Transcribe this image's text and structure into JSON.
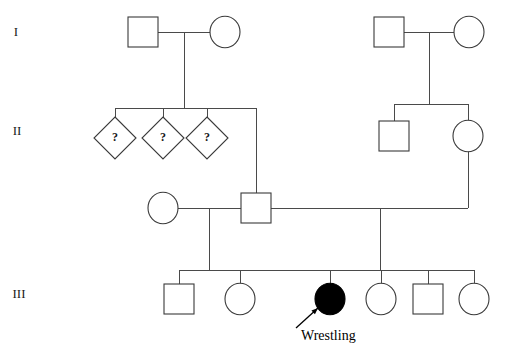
{
  "figure": {
    "type": "pedigree-chart",
    "background_color": "#ffffff",
    "line_color": "#4a4a4a",
    "symbol_stroke_color": "#3a3a3a",
    "affected_fill_color": "#000000",
    "unaffected_fill_color": "#ffffff",
    "width": 505,
    "height": 359
  },
  "generation_labels": [
    {
      "name": "generation-1",
      "text": "I",
      "x": 16,
      "y": 33
    },
    {
      "name": "generation-2",
      "text": "II",
      "x": 17,
      "y": 132
    },
    {
      "name": "generation-3",
      "text": "III",
      "x": 19,
      "y": 295
    }
  ],
  "annotations": [
    {
      "name": "proband-annotation",
      "text": "Wrestling",
      "text_x": 301,
      "text_y": 337,
      "arrow_from_x": 296,
      "arrow_from_y": 328,
      "arrow_to_x": 318,
      "arrow_to_y": 308,
      "points_to": "individual-iii-3"
    }
  ],
  "individuals": [
    {
      "name": "individual-i-1",
      "generation": "I",
      "sex": "male",
      "shape": "square",
      "affected": false,
      "cx": 143,
      "cy": 32,
      "size": 30,
      "label": ""
    },
    {
      "name": "individual-i-2",
      "generation": "I",
      "sex": "female",
      "shape": "circle",
      "affected": false,
      "cx": 225,
      "cy": 32,
      "size": 30,
      "label": ""
    },
    {
      "name": "individual-i-3",
      "generation": "I",
      "sex": "male",
      "shape": "square",
      "affected": false,
      "cx": 389,
      "cy": 32,
      "size": 30,
      "label": ""
    },
    {
      "name": "individual-i-4",
      "generation": "I",
      "sex": "female",
      "shape": "circle",
      "affected": false,
      "cx": 469,
      "cy": 32,
      "size": 30,
      "label": ""
    },
    {
      "name": "individual-ii-1",
      "generation": "II",
      "sex": "unknown",
      "shape": "diamond",
      "affected": false,
      "cx": 115,
      "cy": 138,
      "size": 42,
      "label": "?"
    },
    {
      "name": "individual-ii-2",
      "generation": "II",
      "sex": "unknown",
      "shape": "diamond",
      "affected": false,
      "cx": 163,
      "cy": 138,
      "size": 42,
      "label": "?"
    },
    {
      "name": "individual-ii-3",
      "generation": "II",
      "sex": "unknown",
      "shape": "diamond",
      "affected": false,
      "cx": 207,
      "cy": 138,
      "size": 42,
      "label": "?"
    },
    {
      "name": "individual-ii-4",
      "generation": "II",
      "sex": "male",
      "shape": "square",
      "affected": false,
      "cx": 394,
      "cy": 136,
      "size": 30,
      "label": ""
    },
    {
      "name": "individual-ii-5",
      "generation": "II",
      "sex": "female",
      "shape": "circle",
      "affected": false,
      "cx": 468,
      "cy": 136,
      "size": 30,
      "label": ""
    },
    {
      "name": "individual-ii-6",
      "generation": "II",
      "sex": "female",
      "shape": "circle",
      "affected": false,
      "cx": 163,
      "cy": 208,
      "size": 30,
      "label": ""
    },
    {
      "name": "individual-ii-7",
      "generation": "II",
      "sex": "male",
      "shape": "square",
      "affected": false,
      "cx": 256,
      "cy": 208,
      "size": 30,
      "label": ""
    },
    {
      "name": "individual-iii-1",
      "generation": "III",
      "sex": "male",
      "shape": "square",
      "affected": false,
      "cx": 179,
      "cy": 299,
      "size": 30,
      "label": ""
    },
    {
      "name": "individual-iii-2",
      "generation": "III",
      "sex": "female",
      "shape": "circle",
      "affected": false,
      "cx": 240,
      "cy": 299,
      "size": 30,
      "label": ""
    },
    {
      "name": "individual-iii-3",
      "generation": "III",
      "sex": "female",
      "shape": "circle",
      "affected": true,
      "cx": 330,
      "cy": 299,
      "size": 30,
      "label": ""
    },
    {
      "name": "individual-iii-4",
      "generation": "III",
      "sex": "female",
      "shape": "circle",
      "affected": false,
      "cx": 381,
      "cy": 299,
      "size": 30,
      "label": ""
    },
    {
      "name": "individual-iii-5",
      "generation": "III",
      "sex": "male",
      "shape": "square",
      "affected": false,
      "cx": 428,
      "cy": 299,
      "size": 30,
      "label": ""
    },
    {
      "name": "individual-iii-6",
      "generation": "III",
      "sex": "female",
      "shape": "circle",
      "affected": false,
      "cx": 474,
      "cy": 299,
      "size": 30,
      "label": ""
    }
  ],
  "connectors": [
    {
      "name": "mating-line-i-left",
      "type": "mating",
      "points": "158,32 210,32"
    },
    {
      "name": "mating-line-i-right",
      "type": "mating",
      "points": "404,32 454,32"
    },
    {
      "name": "descent-i-left",
      "type": "descent",
      "points": "184,32 184,108"
    },
    {
      "name": "descent-i-right",
      "type": "descent",
      "points": "429,32 429,104"
    },
    {
      "name": "sibship-line-ii-left",
      "type": "sibship",
      "points": "115,108 256,108"
    },
    {
      "name": "sibship-line-ii-right",
      "type": "sibship",
      "points": "394,104 468,104"
    },
    {
      "name": "stem-ii-1",
      "type": "stem",
      "points": "115,108 115,117"
    },
    {
      "name": "stem-ii-2",
      "type": "stem",
      "points": "163,108 163,117"
    },
    {
      "name": "stem-ii-3",
      "type": "stem",
      "points": "207,108 207,117"
    },
    {
      "name": "stem-ii-4",
      "type": "stem",
      "points": "394,104 394,121"
    },
    {
      "name": "stem-ii-5",
      "type": "stem",
      "points": "468,104 468,121"
    },
    {
      "name": "stem-ii-7",
      "type": "stem",
      "points": "256,108 256,193"
    },
    {
      "name": "mating-line-ii-center",
      "type": "mating",
      "points": "178,208 241,208"
    },
    {
      "name": "mating-line-ii-right",
      "type": "mating",
      "points": "271,208 468,208"
    },
    {
      "name": "descent-ii-5",
      "type": "descent",
      "points": "468,151 468,208"
    },
    {
      "name": "descent-ii-couple",
      "type": "descent",
      "points": "209,208 209,270"
    },
    {
      "name": "descent-ii-union",
      "type": "descent",
      "points": "380,208 380,270"
    },
    {
      "name": "sibship-line-iii",
      "type": "sibship",
      "points": "179,270 474,270"
    },
    {
      "name": "stem-iii-1",
      "type": "stem",
      "points": "179,270 179,284"
    },
    {
      "name": "stem-iii-2",
      "type": "stem",
      "points": "240,270 240,284"
    },
    {
      "name": "stem-iii-3",
      "type": "stem",
      "points": "330,270 330,284"
    },
    {
      "name": "stem-iii-4",
      "type": "stem",
      "points": "381,270 381,284"
    },
    {
      "name": "stem-iii-5",
      "type": "stem",
      "points": "428,270 428,284"
    },
    {
      "name": "stem-iii-6",
      "type": "stem",
      "points": "474,270 474,284"
    }
  ]
}
